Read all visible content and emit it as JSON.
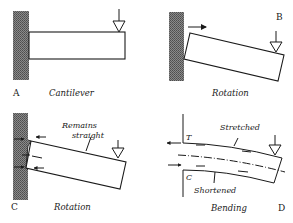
{
  "figure": {
    "panels": [
      {
        "id": "A",
        "letter": "A",
        "caption": "Cantilever"
      },
      {
        "id": "B",
        "letter": "B",
        "caption": "Rotation"
      },
      {
        "id": "C",
        "letter": "C",
        "caption": "Rotation",
        "annotation_line1": "Remains",
        "annotation_line2": "straight"
      },
      {
        "id": "D",
        "letter": "D",
        "caption": "Bending",
        "label_top": "Stretched",
        "label_bottom": "Shortened",
        "tension_mark": "T",
        "compression_mark": "C"
      }
    ],
    "colors": {
      "ink": "#1a1a1a",
      "wall": "#6e6e6e",
      "background": "#ffffff"
    }
  }
}
